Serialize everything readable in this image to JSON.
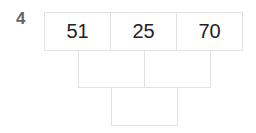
{
  "question_number": "4",
  "pyramid": {
    "row1": [
      "51",
      "25",
      "70"
    ],
    "row2": [
      "",
      ""
    ],
    "row3": [
      ""
    ]
  }
}
